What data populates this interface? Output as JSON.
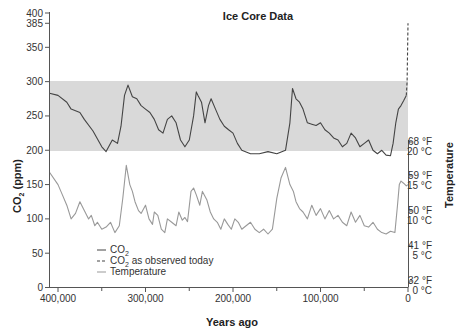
{
  "chart_data": {
    "type": "line",
    "title": "Ice Core Data",
    "xlabel": "Years ago",
    "ylabel": "CO2 (ppm)",
    "ylabel_right": "Temperature",
    "xlim": [
      400000,
      0
    ],
    "ylim": [
      0,
      400
    ],
    "x_ticks": [
      "400,000",
      "300,000",
      "200,000",
      "100,000",
      "0"
    ],
    "y_ticks": [
      "0",
      "50",
      "100",
      "150",
      "200",
      "250",
      "300",
      "350",
      "385",
      "400"
    ],
    "y_ticks_right": [
      {
        "f": "32 °F",
        "c": "0 °C"
      },
      {
        "f": "41 °F",
        "c": "5 °C"
      },
      {
        "f": "50 °F",
        "c": "10 °C"
      },
      {
        "f": "59 °F",
        "c": "15 °C"
      },
      {
        "f": "68 °F",
        "c": "20 °C"
      }
    ],
    "shaded_band": {
      "from": 190,
      "to": 290,
      "color": "#d9d9d9"
    },
    "legend": [
      "CO2",
      "CO2 as observed today",
      "Temperature"
    ],
    "series": [
      {
        "name": "CO2",
        "color": "#444444",
        "style": "solid",
        "x": [
          410000,
          400000,
          390000,
          385000,
          375000,
          370000,
          360000,
          350000,
          345000,
          338000,
          332000,
          328000,
          324000,
          320000,
          315000,
          310000,
          305000,
          300000,
          295000,
          290000,
          285000,
          280000,
          275000,
          270000,
          265000,
          260000,
          255000,
          250000,
          245000,
          242000,
          240000,
          236000,
          232000,
          228000,
          225000,
          220000,
          215000,
          210000,
          205000,
          200000,
          195000,
          190000,
          180000,
          170000,
          160000,
          150000,
          140000,
          135000,
          132000,
          128000,
          124000,
          120000,
          115000,
          110000,
          105000,
          100000,
          95000,
          90000,
          85000,
          80000,
          75000,
          70000,
          65000,
          60000,
          55000,
          50000,
          45000,
          40000,
          35000,
          30000,
          25000,
          20000,
          17000,
          14000,
          11000,
          8000,
          5000,
          2000
        ],
        "values": [
          283,
          280,
          270,
          260,
          255,
          245,
          228,
          205,
          198,
          215,
          210,
          235,
          280,
          295,
          278,
          275,
          265,
          260,
          255,
          245,
          230,
          225,
          245,
          250,
          240,
          215,
          205,
          215,
          250,
          285,
          280,
          270,
          240,
          265,
          275,
          260,
          245,
          235,
          230,
          225,
          210,
          200,
          195,
          195,
          198,
          195,
          200,
          240,
          290,
          275,
          270,
          260,
          240,
          238,
          236,
          240,
          230,
          225,
          218,
          215,
          205,
          210,
          225,
          218,
          205,
          210,
          215,
          200,
          195,
          200,
          193,
          192,
          210,
          240,
          260,
          265,
          272,
          280
        ]
      },
      {
        "name": "CO2 as observed today",
        "color": "#444444",
        "style": "dashed",
        "x": [
          2000,
          1000,
          0
        ],
        "values": [
          280,
          300,
          385
        ]
      },
      {
        "name": "Temperature",
        "color": "#999999",
        "style": "solid",
        "x": [
          410000,
          400000,
          395000,
          390000,
          385000,
          380000,
          375000,
          370000,
          365000,
          362000,
          358000,
          355000,
          350000,
          345000,
          340000,
          335000,
          330000,
          326000,
          322000,
          318000,
          315000,
          312000,
          308000,
          305000,
          300000,
          296000,
          292000,
          290000,
          286000,
          282000,
          278000,
          275000,
          270000,
          265000,
          262000,
          258000,
          255000,
          252000,
          248000,
          245000,
          242000,
          238000,
          235000,
          230000,
          226000,
          222000,
          218000,
          214000,
          210000,
          206000,
          202000,
          198000,
          194000,
          190000,
          185000,
          180000,
          175000,
          170000,
          165000,
          160000,
          155000,
          150000,
          145000,
          140000,
          135000,
          131000,
          128000,
          124000,
          120000,
          115000,
          110000,
          105000,
          100000,
          95000,
          90000,
          85000,
          80000,
          75000,
          70000,
          65000,
          60000,
          55000,
          50000,
          45000,
          40000,
          35000,
          30000,
          25000,
          20000,
          15000,
          12000,
          10000,
          8000,
          5000,
          2000,
          0
        ],
        "values": [
          168,
          150,
          135,
          120,
          100,
          108,
          125,
          112,
          100,
          105,
          90,
          95,
          85,
          88,
          95,
          80,
          90,
          130,
          178,
          150,
          140,
          125,
          112,
          108,
          120,
          100,
          92,
          110,
          105,
          85,
          80,
          100,
          95,
          90,
          110,
          98,
          102,
          96,
          140,
          145,
          135,
          120,
          140,
          128,
          110,
          100,
          95,
          85,
          100,
          92,
          85,
          100,
          95,
          85,
          90,
          95,
          85,
          80,
          85,
          78,
          85,
          130,
          160,
          175,
          150,
          140,
          125,
          115,
          110,
          100,
          120,
          105,
          115,
          100,
          112,
          100,
          105,
          95,
          90,
          110,
          95,
          105,
          90,
          88,
          95,
          85,
          80,
          78,
          82,
          80,
          120,
          150,
          155,
          152,
          148,
          150
        ]
      }
    ]
  }
}
